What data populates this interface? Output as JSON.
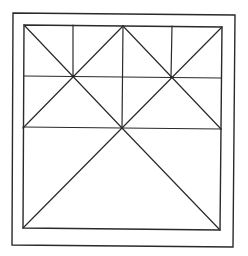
{
  "diagram": {
    "type": "geometric-line-figure",
    "background_color": "#ffffff",
    "line_color": "#2a2a2a",
    "outer_frame": {
      "points": [
        [
          13,
          13
        ],
        [
          235,
          15
        ],
        [
          233,
          247
        ],
        [
          12,
          245
        ]
      ],
      "stroke_width": 1.4
    },
    "inner_square": {
      "points": [
        [
          24,
          25
        ],
        [
          222,
          27
        ],
        [
          220,
          230
        ],
        [
          23,
          228
        ]
      ],
      "stroke_width": 1.4
    },
    "lines": [
      {
        "id": "top-vertical-center",
        "x1": 123,
        "y1": 26,
        "x2": 122,
        "y2": 128
      },
      {
        "id": "top-vertical-left",
        "x1": 73,
        "y1": 25,
        "x2": 73,
        "y2": 77
      },
      {
        "id": "top-vertical-right",
        "x1": 172,
        "y1": 26,
        "x2": 171,
        "y2": 77
      },
      {
        "id": "horizontal-upper",
        "x1": 24,
        "y1": 76,
        "x2": 221,
        "y2": 78
      },
      {
        "id": "horizontal-middle",
        "x1": 23,
        "y1": 127,
        "x2": 221,
        "y2": 129
      },
      {
        "id": "diag-left-quad-1",
        "x1": 24,
        "y1": 25,
        "x2": 122,
        "y2": 128
      },
      {
        "id": "diag-left-quad-2",
        "x1": 123,
        "y1": 26,
        "x2": 23,
        "y2": 128
      },
      {
        "id": "diag-right-quad-1",
        "x1": 123,
        "y1": 26,
        "x2": 221,
        "y2": 129
      },
      {
        "id": "diag-right-quad-2",
        "x1": 222,
        "y1": 27,
        "x2": 122,
        "y2": 128
      },
      {
        "id": "diag-lower-left",
        "x1": 122,
        "y1": 128,
        "x2": 23,
        "y2": 228
      },
      {
        "id": "diag-lower-right",
        "x1": 122,
        "y1": 128,
        "x2": 220,
        "y2": 230
      }
    ],
    "intersections": [
      [
        73,
        76
      ],
      [
        171,
        77
      ],
      [
        122,
        128
      ]
    ]
  }
}
